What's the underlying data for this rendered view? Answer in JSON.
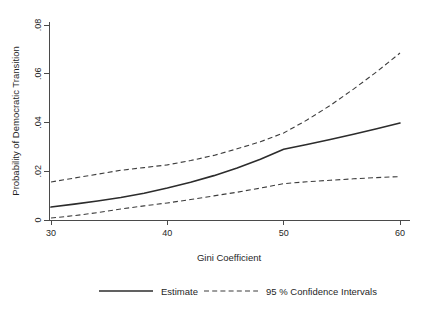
{
  "chart_data": {
    "type": "line",
    "title": "",
    "xlabel": "Gini Coefficient",
    "ylabel": "Probability of Democratic Transition",
    "xlim": [
      30,
      60
    ],
    "ylim": [
      0,
      0.08
    ],
    "xticks": [
      30,
      40,
      50,
      60
    ],
    "xtick_labels": [
      "30",
      "40",
      "50",
      "60"
    ],
    "yticks": [
      0,
      0.02,
      0.04,
      0.06,
      0.08
    ],
    "ytick_labels": [
      "0",
      ".02",
      ".04",
      ".06",
      ".08"
    ],
    "grid": false,
    "legend_position": "below-center",
    "x": [
      30,
      32,
      34,
      36,
      38,
      40,
      42,
      44,
      46,
      48,
      50,
      52,
      54,
      56,
      58,
      60
    ],
    "series": [
      {
        "name": "Estimate",
        "style": "solid",
        "color": "#2c2c2c",
        "values": [
          0.0053,
          0.0065,
          0.0078,
          0.0092,
          0.011,
          0.0131,
          0.0155,
          0.0182,
          0.0213,
          0.0249,
          0.029,
          0.031,
          0.033,
          0.0352,
          0.0374,
          0.0398
        ]
      },
      {
        "name": "95 % Confidence Intervals (upper)",
        "style": "dashed",
        "color": "#3d3d3d",
        "values": [
          0.0156,
          0.0172,
          0.0188,
          0.0204,
          0.0215,
          0.0226,
          0.0244,
          0.0265,
          0.0292,
          0.0321,
          0.0357,
          0.041,
          0.047,
          0.0537,
          0.0608,
          0.0685
        ]
      },
      {
        "name": "95 % Confidence Intervals (lower)",
        "style": "dashed",
        "color": "#3d3d3d",
        "values": [
          0.0008,
          0.0018,
          0.003,
          0.0045,
          0.0058,
          0.007,
          0.0084,
          0.0099,
          0.0114,
          0.0131,
          0.0149,
          0.0157,
          0.0163,
          0.0169,
          0.0174,
          0.0178
        ]
      }
    ]
  },
  "legend": {
    "items": [
      {
        "label": "Estimate",
        "style": "solid"
      },
      {
        "label": "95 % Confidence Intervals",
        "style": "dashed"
      }
    ]
  },
  "colors": {
    "background": "#ffffff",
    "axis": "#4a4a4a",
    "estimate": "#2c2c2c",
    "confidence": "#3d3d3d",
    "text": "#1f1f1f"
  }
}
